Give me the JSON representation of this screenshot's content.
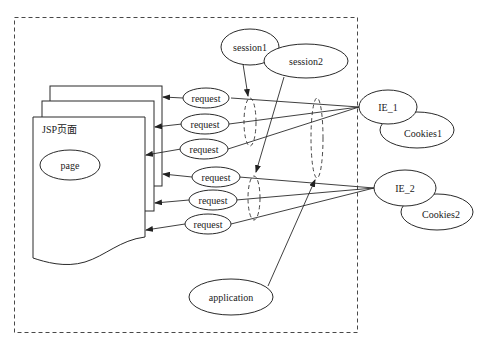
{
  "diagram": {
    "type": "jsp-scope-diagram",
    "container": {
      "label": ""
    },
    "jsp_page": {
      "title": "JSP页面",
      "inner": "page"
    },
    "sessions": [
      {
        "id": "session1",
        "label": "session1"
      },
      {
        "id": "session2",
        "label": "session2"
      }
    ],
    "requests": [
      {
        "label": "request",
        "client": "IE_1"
      },
      {
        "label": "request",
        "client": "IE_1"
      },
      {
        "label": "request",
        "client": "IE_1"
      },
      {
        "label": "request",
        "client": "IE_2"
      },
      {
        "label": "request",
        "client": "IE_2"
      },
      {
        "label": "request",
        "client": "IE_2"
      }
    ],
    "clients": [
      {
        "label": "IE_1",
        "cookies": "Cookies1"
      },
      {
        "label": "IE_2",
        "cookies": "Cookies2"
      }
    ],
    "application": {
      "label": "application"
    },
    "edges": [
      {
        "from": "IE_1",
        "to": "request",
        "count": 3
      },
      {
        "from": "IE_2",
        "to": "request",
        "count": 3
      },
      {
        "from": "request",
        "to": "JSP页面",
        "count": 6,
        "arrow": true
      },
      {
        "from": "session1",
        "to": "IE_1 request group",
        "arrow": true,
        "style": "dashed-scope"
      },
      {
        "from": "session2",
        "to": "IE_2 request group",
        "arrow": true,
        "style": "dashed-scope"
      },
      {
        "from": "application",
        "to": "all requests",
        "arrow": true,
        "style": "dashed-scope"
      }
    ]
  }
}
